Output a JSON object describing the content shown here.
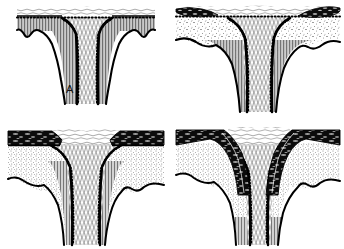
{
  "figure": {
    "background_color": "#ffffff",
    "width": 344,
    "height": 249,
    "layout": "2x2 panel grid",
    "ink_color": "#000000",
    "hatch_gray": "#9a9a9a",
    "dark_band_color": "#111111"
  },
  "panels": [
    {
      "id": "A",
      "label": "A",
      "position": "top-left",
      "description": "Funnel structure with gray vertical-hatched host unit; scalloped cuspate lower contact with three rounded lobes on the left and two on the right; beaded dotted margin along the funnel walls; fibrous vertical fill in the central throat.",
      "features": {
        "top_surface": "irregular stippled cap",
        "margin_style": "beaded dotted line",
        "host_fill": "vertical line hatch, gray",
        "throat_fill": "wavy vertical fibrous lines",
        "dark_lenses": "none",
        "lower_contact": "scalloped cuspate lobes"
      }
    },
    {
      "id": "B",
      "label": "B",
      "position": "top-right",
      "description": "Same funnel with two dark elongated lenses at the upper left and upper right corners; stippled unit above a gray vertical-hatched unit; undulating lower contact with broad cusps.",
      "features": {
        "top_surface": "stippled cap with dark lenses",
        "margin_style": "beaded dotted line",
        "host_fill": "vertical line hatch, gray, beneath stipple",
        "throat_fill": "wavy vertical fibrous lines",
        "dark_lenses": "two, upper-left and upper-right",
        "lower_contact": "undulating with broad cusps"
      }
    },
    {
      "id": "C",
      "label": "C",
      "position": "bottom-left",
      "description": "Funnel with a thick continuous dark band across the top, truncated at the funnel walls; body dominated by fine stipple; narrow gray hatch restricted to the funnel margins; gently undulating lower contact.",
      "features": {
        "top_surface": "thick dark banded layer",
        "margin_style": "beaded dotted line",
        "host_fill": "fine stipple",
        "throat_fill": "wavy vertical fibrous lines",
        "dark_lenses": "continuous dark band, left and right",
        "lower_contact": "gently undulating"
      }
    },
    {
      "id": "D",
      "label": "D",
      "position": "bottom-right",
      "description": "Funnel with thick dark bands that bend downward and drape into the funnel throat on both sides; stippled body; gray hatch appears at the base of the throat; undulating lower contact.",
      "features": {
        "top_surface": "thick dark banded layer deflected into the funnel",
        "margin_style": "beaded dotted line",
        "host_fill": "fine stipple",
        "throat_fill": "wavy vertical fibrous lines with gray hatch at base",
        "dark_lenses": "down-warped dark bands entering the throat",
        "lower_contact": "undulating"
      }
    }
  ]
}
